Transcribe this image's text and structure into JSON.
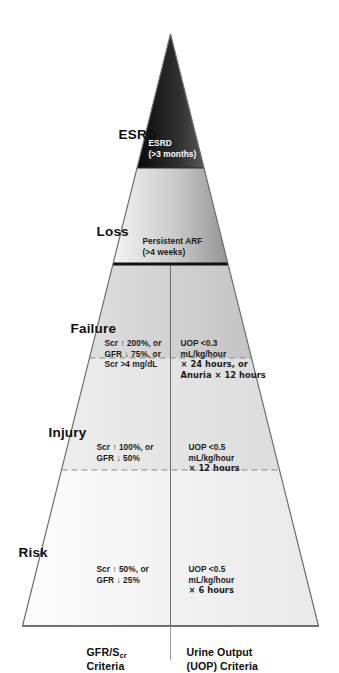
{
  "figure": {
    "orientation": "rotated-90-ccw",
    "stages": [
      {
        "id": "risk",
        "name": "Risk",
        "gfr_scr": [
          "Scr ↑ 50%, or",
          "GFR ↓ 25%"
        ],
        "uop": [
          "UOP <0.5",
          "mL/kg/hour",
          "× 6 hours"
        ],
        "fill_top": "#fbfbfb",
        "fill_bottom": "#ededed",
        "divider": "dashed"
      },
      {
        "id": "injury",
        "name": "Injury",
        "gfr_scr": [
          "Scr ↑ 100%, or",
          "GFR ↓ 50%"
        ],
        "uop": [
          "UOP <0.5",
          "mL/kg/hour",
          "× 12 hours"
        ],
        "fill_top": "#ebebeb",
        "fill_bottom": "#dddddd",
        "divider": "dashed"
      },
      {
        "id": "failure",
        "name": "Failure",
        "gfr_scr": [
          "Scr ↑ 200%, or",
          "GFR ↓ 75%, or",
          "Scr >4 mg/dL"
        ],
        "uop": [
          "UOP <0.3",
          "mL/kg/hour",
          "× 24 hours, or",
          "Anuria × 12 hours"
        ],
        "fill_top": "#dcdcdc",
        "fill_bottom": "#c6c6c6",
        "divider": "solid-thick"
      },
      {
        "id": "loss",
        "name": "Loss",
        "body": [
          "Persistent ARF",
          "(>4 weeks)"
        ],
        "fill_top": "#f2f2f2",
        "fill_bottom": "#9a9a9a",
        "divider": "solid-thin"
      },
      {
        "id": "esrd",
        "name": "ESRD",
        "body": [
          "ESRD",
          "(>3 months)"
        ],
        "fill_top": "#111111",
        "fill_bottom": "#4a4a4a",
        "text_color": "#ffffff"
      }
    ],
    "axes": {
      "left_column": {
        "line1": "GFR/S",
        "line1_sub": "cr",
        "line2": "Criteria"
      },
      "right_column": {
        "line1": "Urine Output",
        "line2": "(UOP) Criteria"
      }
    },
    "colors": {
      "outline": "#6e6e6e",
      "divider_dashed": "#8a8a8a",
      "divider_solid": "#111111",
      "text": "#161616",
      "text_inverse": "#ffffff",
      "background": "#ffffff"
    }
  }
}
